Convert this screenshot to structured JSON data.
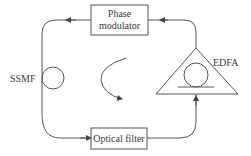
{
  "diagram": {
    "type": "fiber-ring-laser-schematic",
    "components": {
      "phase_modulator": {
        "line1": "Phase",
        "line2": "modulator"
      },
      "optical_filter": {
        "label": "Optical filter"
      },
      "edfa": {
        "label": "EDFA"
      },
      "ssmf": {
        "label": "SSMF"
      }
    },
    "flow_direction": "counter-clockwise",
    "colors": {
      "stroke": "#555555",
      "text": "#3a3a3a",
      "background": "#ffffff"
    }
  }
}
